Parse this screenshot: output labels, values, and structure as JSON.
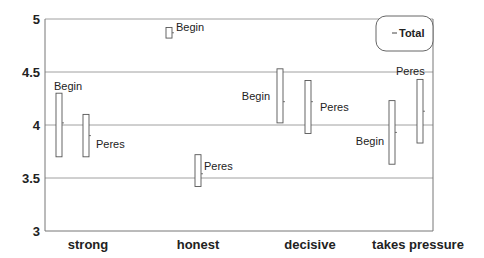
{
  "chart_data": {
    "type": "range-bar",
    "title": "",
    "xlabel": "",
    "ylabel": "",
    "ylim": [
      3,
      5
    ],
    "yticks": [
      "3",
      "3.5",
      "4",
      "4.5",
      "5"
    ],
    "grid": "horizontal",
    "categories": [
      "strong",
      "honest",
      "decisive",
      "takes pressure"
    ],
    "legend": {
      "position": "top-right",
      "entries": [
        "Total"
      ]
    },
    "series": [
      {
        "name": "Begin",
        "low": [
          3.7,
          4.82,
          4.02,
          3.63
        ],
        "high": [
          4.3,
          4.92,
          4.53,
          4.23
        ],
        "mark": [
          4.02,
          4.87,
          4.22,
          3.93
        ]
      },
      {
        "name": "Peres",
        "low": [
          3.7,
          3.42,
          3.92,
          3.83
        ],
        "high": [
          4.1,
          3.72,
          4.42,
          4.43
        ],
        "mark": [
          3.9,
          3.54,
          4.22,
          4.13
        ]
      }
    ]
  },
  "colors": {
    "axis": "#777777",
    "grid": "#888888",
    "bar_stroke": "#555555",
    "text": "#222222"
  }
}
